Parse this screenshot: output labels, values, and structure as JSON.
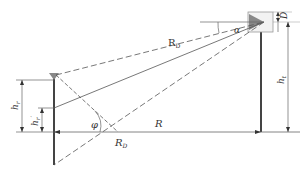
{
  "diagram": {
    "type": "geometry-schematic",
    "colors": {
      "line": "#444444",
      "dash": "#555555",
      "antenna_fill": "#888888",
      "background": "#ffffff"
    },
    "labels": {
      "rd_top": "R",
      "rd_top_sub": "D",
      "alpha": "α",
      "d": "D",
      "ht": "h",
      "ht_sub": "t",
      "hr": "h",
      "hr_sub": "r",
      "hr_prime": "h",
      "hr_prime_sub": "r",
      "hr_prime_mark": "′",
      "phi": "φ",
      "r": "R",
      "rd_bottom": "R",
      "rd_bottom_sub": "D"
    },
    "caption": ""
  }
}
